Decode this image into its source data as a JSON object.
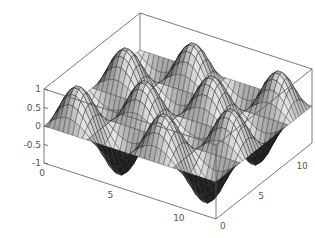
{
  "chart_data": {
    "type": "surface3d",
    "title": "",
    "function": "sin(x) * sin(y)",
    "x_range": [
      0,
      12.566
    ],
    "y_range": [
      0,
      12.566
    ],
    "z_range": [
      -1,
      1
    ],
    "grid_lines": 36,
    "z_ticks": [
      {
        "value": 1,
        "label": "1"
      },
      {
        "value": 0.5,
        "label": "0.5"
      },
      {
        "value": 0,
        "label": "0"
      },
      {
        "value": -0.5,
        "label": "-0.5"
      },
      {
        "value": -1,
        "label": "-1"
      }
    ],
    "x_ticks": [
      {
        "value": 0,
        "label": "0"
      },
      {
        "value": 5,
        "label": "5"
      },
      {
        "value": 10,
        "label": "10"
      }
    ],
    "y_ticks": [
      {
        "value": 0,
        "label": "0"
      },
      {
        "value": 5,
        "label": "5"
      },
      {
        "value": 10,
        "label": "10"
      }
    ],
    "box": true,
    "shading": "grayscale",
    "colors": {
      "box": "#555555",
      "mesh": "#222222",
      "surface_light": "#e6e6e6",
      "surface_dark": "#1a1a1a"
    }
  }
}
